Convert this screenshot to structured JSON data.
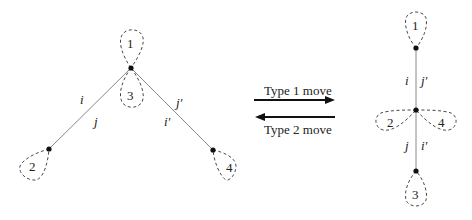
{
  "left_graph": {
    "loops": [
      "1",
      "3",
      "2",
      "4"
    ],
    "edge_labels": {
      "i": "i",
      "j": "j",
      "jp": "j′",
      "ip": "i′"
    }
  },
  "moves": {
    "forward": "Type 1 move",
    "backward": "Type 2 move"
  },
  "right_graph": {
    "loops": [
      "1",
      "2",
      "4",
      "3"
    ],
    "edge_labels": {
      "i": "i",
      "jp": "j′",
      "j": "j",
      "ip": "i′"
    }
  }
}
